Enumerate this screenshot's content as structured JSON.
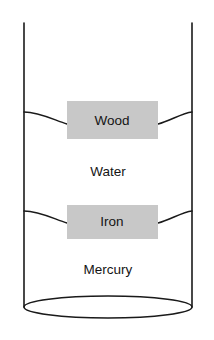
{
  "figure": {
    "background_color": "#ffffff",
    "line_color": "#1a1a1a",
    "block_fill_color": "#c8c8c8",
    "text_color": "#141414"
  },
  "vessel": {
    "name": "cylinder",
    "left_wall_x": 24,
    "right_wall_x": 192,
    "top_y": 23,
    "bottom_y": 317,
    "bottom_ellipse_center_y": 307,
    "bottom_ellipse_rx": 84,
    "bottom_ellipse_ry": 11
  },
  "layers": [
    {
      "name": "water",
      "label": "Water",
      "label_x": 108,
      "label_y": 172,
      "surface_wall_y": 113,
      "surface_center_y": 124
    },
    {
      "name": "mercury",
      "label": "Mercury",
      "label_x": 108,
      "label_y": 270,
      "surface_wall_y": 212,
      "surface_center_y": 223
    }
  ],
  "blocks": [
    {
      "name": "wood",
      "label": "Wood",
      "x": 67,
      "y": 101,
      "width": 91,
      "height": 38,
      "label_x": 112,
      "label_y": 121
    },
    {
      "name": "iron",
      "label": "Iron",
      "x": 67,
      "y": 205,
      "width": 91,
      "height": 34,
      "label_x": 112,
      "label_y": 222
    }
  ]
}
